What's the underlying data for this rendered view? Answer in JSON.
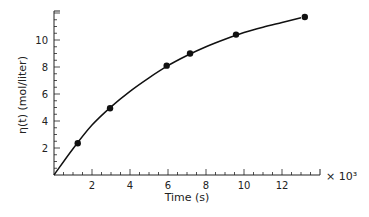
{
  "chart_data": {
    "type": "line",
    "title": "",
    "xlabel": "Time (s)",
    "ylabel": "η(t) (mol/liter)",
    "x_multiplier": "× 10³",
    "xlim": [
      0,
      14
    ],
    "ylim": [
      0,
      12
    ],
    "xticks": [
      2,
      4,
      6,
      8,
      10,
      12
    ],
    "yticks": [
      2,
      4,
      6,
      8,
      10
    ],
    "grid": false,
    "legend": null,
    "series": [
      {
        "name": "measured",
        "style": "markers",
        "x": [
          1.25,
          2.95,
          5.93,
          7.16,
          9.58,
          13.2
        ],
        "y": [
          2.35,
          4.94,
          8.1,
          9.0,
          10.4,
          11.7
        ]
      },
      {
        "name": "fit",
        "style": "smooth-curve",
        "x": [
          0,
          1,
          2,
          3,
          4,
          5,
          6,
          7,
          8,
          9,
          10,
          11,
          12,
          13,
          14
        ],
        "y": [
          0,
          1.95,
          3.7,
          5.05,
          6.2,
          7.2,
          8.1,
          8.85,
          9.5,
          10.05,
          10.55,
          10.95,
          11.3,
          11.65,
          11.9
        ]
      }
    ]
  }
}
